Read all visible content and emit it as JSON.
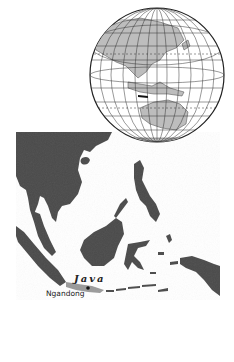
{
  "map": {
    "region": "Southeast Asia",
    "inset": "globe-locator",
    "labels": {
      "island": "Java",
      "site": "Ngandong"
    },
    "colors": {
      "land": "#4a4a4a",
      "sea": "#ffffff",
      "globe_land": "#bdbdbd",
      "globe_grid": "#333333",
      "highlight": "#9a9a9a"
    }
  }
}
